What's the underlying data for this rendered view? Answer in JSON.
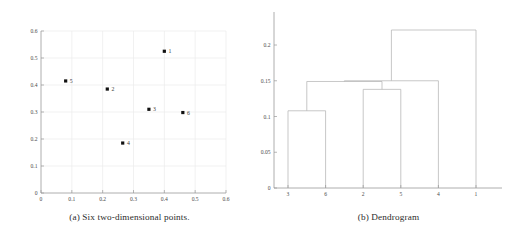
{
  "figure": {
    "panel_a": {
      "caption": "(a) Six two-dimensional points.",
      "caption_marker": "(a)"
    },
    "panel_b": {
      "caption": "(b) Dendrogram",
      "caption_marker": "(b)"
    }
  },
  "chart_data": [
    {
      "type": "scatter",
      "title": "(a) Six two-dimensional points.",
      "xlabel": "",
      "ylabel": "",
      "xlim": [
        0,
        0.6
      ],
      "ylim": [
        0,
        0.6
      ],
      "grid": true,
      "legend": "none",
      "xticks": [
        "0",
        "0.1",
        "0.2",
        "0.3",
        "0.4",
        "0.5",
        "0.6"
      ],
      "yticks": [
        "0",
        "0.1",
        "0.2",
        "0.3",
        "0.4",
        "0.5",
        "0.6"
      ],
      "xtick_values": [
        0,
        0.1,
        0.2,
        0.3,
        0.4,
        0.5,
        0.6
      ],
      "ytick_values": [
        0,
        0.1,
        0.2,
        0.3,
        0.4,
        0.5,
        0.6
      ],
      "points": [
        {
          "label": "1",
          "x": 0.4,
          "y": 0.525
        },
        {
          "label": "2",
          "x": 0.215,
          "y": 0.385
        },
        {
          "label": "3",
          "x": 0.35,
          "y": 0.31
        },
        {
          "label": "4",
          "x": 0.265,
          "y": 0.185
        },
        {
          "label": "5",
          "x": 0.08,
          "y": 0.415
        },
        {
          "label": "6",
          "x": 0.46,
          "y": 0.298
        }
      ]
    },
    {
      "type": "dendrogram",
      "title": "(b) Dendrogram",
      "xlabel": "",
      "ylabel": "",
      "ylim": [
        0,
        0.235
      ],
      "grid": false,
      "legend": "none",
      "yticks": [
        "0",
        "0.05",
        "0.1",
        "0.15",
        "0.2"
      ],
      "ytick_values": [
        0,
        0.05,
        0.1,
        0.15,
        0.2
      ],
      "leaf_order": [
        "3",
        "6",
        "2",
        "5",
        "4",
        "1"
      ],
      "merges": [
        {
          "id": "m1",
          "left": "3",
          "right": "6",
          "height": 0.108
        },
        {
          "id": "m2",
          "left": "2",
          "right": "5",
          "height": 0.138
        },
        {
          "id": "m3",
          "left": "m1",
          "right": "m2",
          "height": 0.149
        },
        {
          "id": "m4",
          "left": "m3",
          "right": "4",
          "height": 0.15
        },
        {
          "id": "m5",
          "left": "m4",
          "right": "1",
          "height": 0.221
        }
      ]
    }
  ],
  "colors": {
    "point": "#111111",
    "axis": "#9a9a9a",
    "grid": "#ebebeb",
    "dendrogram_link": "#b4b4b4",
    "text": "#2b2b2b",
    "background": "#ffffff"
  }
}
